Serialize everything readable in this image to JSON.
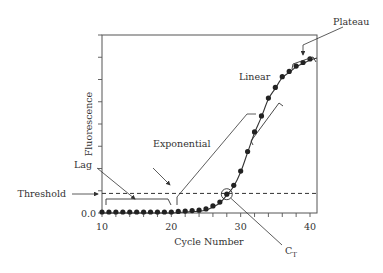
{
  "chart_data": {
    "type": "scatter",
    "title": "",
    "xlabel": "Cycle Number",
    "ylabel": "Fluorescence",
    "xlim": [
      10,
      41
    ],
    "ylim": [
      0,
      1.0
    ],
    "x_ticks": [
      10,
      20,
      30,
      40
    ],
    "x_minor_step": 2,
    "y_tick_labels": [
      "0.0"
    ],
    "y_tick_count": 8,
    "grid": false,
    "legend": "none",
    "threshold": 0.11,
    "ct_cycle": 28,
    "series": [
      {
        "name": "Fluorescence",
        "x": [
          10,
          11,
          12,
          13,
          14,
          15,
          16,
          17,
          18,
          19,
          20,
          21,
          22,
          23,
          24,
          25,
          26,
          27,
          28,
          29,
          30,
          31,
          32,
          33,
          34,
          35,
          36,
          37,
          38,
          39,
          40
        ],
        "values": [
          0.0,
          0.0,
          0.0,
          0.0,
          0.0,
          0.0,
          0.0,
          0.0,
          0.0,
          0.0,
          0.0,
          0.003,
          0.005,
          0.008,
          0.01,
          0.017,
          0.034,
          0.056,
          0.1,
          0.15,
          0.23,
          0.34,
          0.45,
          0.54,
          0.64,
          0.7,
          0.76,
          0.79,
          0.82,
          0.84,
          0.86
        ]
      }
    ],
    "annotations": [
      {
        "text": "Lag",
        "target": "bracket over cycles 10-20 near baseline"
      },
      {
        "text": "Exponential",
        "target": "rising curve start near cycle 21"
      },
      {
        "text": "Linear",
        "target": "bracket along steep rise cycles ~31-36"
      },
      {
        "text": "Plateau",
        "target": "bracket over cycles ~37-40"
      },
      {
        "text": "Threshold",
        "target": "dashed horizontal threshold line"
      },
      {
        "text": "C",
        "subscript": "T",
        "target": "circled point where curve crosses threshold"
      }
    ]
  },
  "labels": {
    "lag": "Lag",
    "exponential": "Exponential",
    "linear": "Linear",
    "plateau": "Plateau",
    "threshold": "Threshold",
    "ct_main": "C",
    "ct_sub": "T",
    "x_axis": "Cycle Number",
    "y_axis": "Fluorescence",
    "y_zero": "0.0"
  }
}
